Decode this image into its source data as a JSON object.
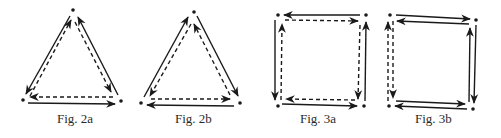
{
  "figures": [
    {
      "id": "fig-2a",
      "caption": "Fig. 2a",
      "shape": "triangle",
      "vertices": [
        [
          73,
          10
        ],
        [
          23,
          100
        ],
        [
          121,
          100
        ]
      ],
      "solid_path_direction": "clockwise: apex→bottom-left→bottom-right→apex (outer)",
      "dashed_path_direction": "counter-clockwise: bottom-left→apex→bottom-right→bottom-left (inner)"
    },
    {
      "id": "fig-2b",
      "caption": "Fig. 2b",
      "shape": "triangle",
      "vertices": [
        [
          194,
          12
        ],
        [
          141,
          103
        ],
        [
          240,
          103
        ]
      ],
      "solid_path_direction": "apex→bottom-right→bottom-left→apex (outer)",
      "dashed_path_direction": "bottom-right→apex→bottom-left→bottom-right (inner)"
    },
    {
      "id": "fig-3a",
      "caption": "Fig. 3a",
      "shape": "square",
      "vertices": [
        [
          278,
          15
        ],
        [
          365,
          15
        ],
        [
          363,
          106
        ],
        [
          278,
          106
        ]
      ],
      "solid_path_direction": "top-right→top-left→bottom-left→bottom-right→top-right (outer)",
      "dashed_path_direction": "bottom-left→top-left→top-right→bottom-right→bottom-left (inner)"
    },
    {
      "id": "fig-3b",
      "caption": "Fig. 3b",
      "shape": "square",
      "vertices": [
        [
          390,
          15
        ],
        [
          476,
          20
        ],
        [
          473,
          109
        ],
        [
          389,
          106
        ]
      ],
      "solid_path_direction": "outer loop clockwise plus inner return, left side dashed",
      "dashed_path_direction": "left edge: bottom→top (outer) and top→bottom (inner)"
    }
  ],
  "colors": {
    "ink": "#1a1a1a",
    "background": "#ffffff"
  }
}
